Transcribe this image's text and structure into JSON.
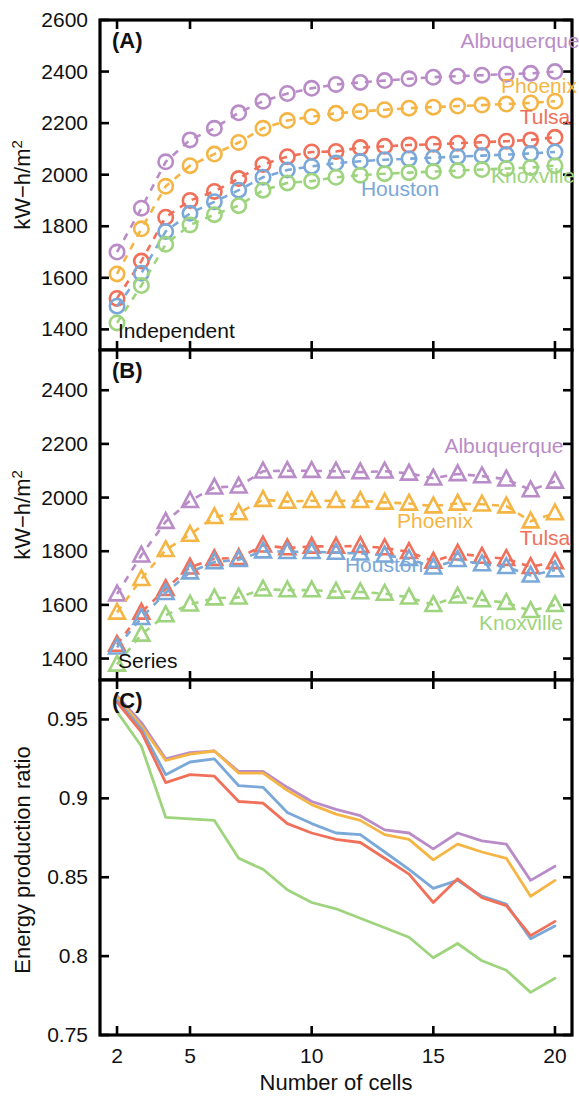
{
  "figure": {
    "xlabel": "Number of cells",
    "ylabel_ab": "kW−h/m",
    "ylabel_ab_sup": "2",
    "ylabel_c": "Energy production ratio",
    "panelA_tag": "(A)",
    "panelB_tag": "(B)",
    "panelC_tag": "(C)",
    "panelA_note": "Independent",
    "panelB_note": "Series"
  },
  "colors": {
    "albuquerque": "#b98cc8",
    "phoenix": "#f5b544",
    "tulsa": "#f0705a",
    "houston": "#7aa8d8",
    "knoxville": "#9ed47e",
    "axis": "#000000"
  },
  "labels_A": [
    {
      "name": "Albuquerque",
      "x": 520,
      "y": 48,
      "anchor": "middle",
      "color": "#b98cc8"
    },
    {
      "name": "Phoenix",
      "x": 539,
      "y": 93,
      "anchor": "middle",
      "color": "#f5b544"
    },
    {
      "name": "Tulsa",
      "x": 545,
      "y": 124,
      "anchor": "middle",
      "color": "#f0705a"
    },
    {
      "name": "Houston",
      "x": 400,
      "y": 196,
      "anchor": "middle",
      "color": "#7aa8d8"
    },
    {
      "name": "Knoxville",
      "x": 533,
      "y": 183,
      "anchor": "middle",
      "color": "#9ed47e"
    }
  ],
  "labels_B": [
    {
      "name": "Albuquerque",
      "x": 504,
      "y": 453,
      "anchor": "middle",
      "color": "#b98cc8"
    },
    {
      "name": "Phoenix",
      "x": 435,
      "y": 528,
      "anchor": "middle",
      "color": "#f5b544"
    },
    {
      "name": "Tulsa",
      "x": 545,
      "y": 545,
      "anchor": "middle",
      "color": "#f0705a"
    },
    {
      "name": "Houston",
      "x": 384,
      "y": 572,
      "anchor": "middle",
      "color": "#7aa8d8"
    },
    {
      "name": "Knoxville",
      "x": 521,
      "y": 630,
      "anchor": "middle",
      "color": "#9ed47e"
    }
  ],
  "chart_data": [
    {
      "type": "line",
      "panel": "A",
      "title": "(A) Independent",
      "xlabel": "Number of cells",
      "ylabel": "kW−h/m2",
      "xlim": [
        1.3,
        20.7
      ],
      "ylim": [
        1320,
        2600
      ],
      "xticks": [
        2,
        5,
        10,
        15,
        20
      ],
      "yticks": [
        1400,
        1600,
        1800,
        2000,
        2200,
        2400,
        2600
      ],
      "grid": false,
      "marker": "circle",
      "linestyle": "dashed",
      "legend_position": "inline-annotations",
      "x": [
        2,
        3,
        4,
        5,
        6,
        7,
        8,
        9,
        10,
        11,
        12,
        13,
        14,
        15,
        16,
        17,
        18,
        19,
        20
      ],
      "series": [
        {
          "name": "Albuquerque",
          "color": "#b98cc8",
          "values": [
            1700,
            1870,
            2050,
            2135,
            2180,
            2240,
            2285,
            2315,
            2335,
            2350,
            2358,
            2365,
            2372,
            2378,
            2382,
            2386,
            2390,
            2393,
            2400
          ]
        },
        {
          "name": "Phoenix",
          "color": "#f5b544",
          "values": [
            1615,
            1790,
            1955,
            2035,
            2080,
            2125,
            2180,
            2210,
            2225,
            2238,
            2245,
            2252,
            2258,
            2262,
            2266,
            2270,
            2274,
            2278,
            2285
          ]
        },
        {
          "name": "Tulsa",
          "color": "#f0705a",
          "values": [
            1520,
            1665,
            1835,
            1900,
            1935,
            1985,
            2040,
            2070,
            2088,
            2090,
            2105,
            2110,
            2115,
            2118,
            2122,
            2126,
            2130,
            2135,
            2145
          ]
        },
        {
          "name": "Houston",
          "color": "#7aa8d8",
          "values": [
            1490,
            1618,
            1780,
            1850,
            1895,
            1940,
            1990,
            2018,
            2032,
            2045,
            2052,
            2058,
            2062,
            2066,
            2070,
            2074,
            2078,
            2082,
            2088
          ]
        },
        {
          "name": "Knoxville",
          "color": "#9ed47e",
          "values": [
            1425,
            1570,
            1730,
            1805,
            1845,
            1880,
            1940,
            1968,
            1975,
            1990,
            1998,
            2004,
            2008,
            2012,
            2016,
            2020,
            2024,
            2028,
            2035
          ]
        }
      ]
    },
    {
      "type": "line",
      "panel": "B",
      "title": "(B) Series",
      "xlabel": "Number of cells",
      "ylabel": "kW−h/m2",
      "xlim": [
        1.3,
        20.7
      ],
      "ylim": [
        1320,
        2550
      ],
      "xticks": [
        2,
        5,
        10,
        15,
        20
      ],
      "yticks": [
        1400,
        1600,
        1800,
        2000,
        2200,
        2400
      ],
      "grid": false,
      "marker": "triangle",
      "linestyle": "dashed",
      "legend_position": "inline-annotations",
      "x": [
        2,
        3,
        4,
        5,
        6,
        7,
        8,
        9,
        10,
        11,
        12,
        13,
        14,
        15,
        16,
        17,
        18,
        19,
        20
      ],
      "series": [
        {
          "name": "Albuquerque",
          "color": "#b98cc8",
          "values": [
            1640,
            1785,
            1910,
            1988,
            2038,
            2042,
            2098,
            2100,
            2100,
            2098,
            2095,
            2098,
            2090,
            2072,
            2088,
            2080,
            2068,
            2028,
            2060
          ]
        },
        {
          "name": "Phoenix",
          "color": "#f5b544",
          "values": [
            1572,
            1697,
            1805,
            1862,
            1928,
            1942,
            1992,
            1985,
            1988,
            1988,
            1988,
            1982,
            1978,
            1968,
            1978,
            1975,
            1968,
            1912,
            1942
          ]
        },
        {
          "name": "Tulsa",
          "color": "#f0705a",
          "values": [
            1452,
            1572,
            1660,
            1740,
            1772,
            1775,
            1822,
            1812,
            1818,
            1818,
            1820,
            1812,
            1798,
            1762,
            1792,
            1780,
            1772,
            1742,
            1760
          ]
        },
        {
          "name": "Houston",
          "color": "#7aa8d8",
          "values": [
            1442,
            1552,
            1645,
            1722,
            1760,
            1768,
            1800,
            1798,
            1798,
            1795,
            1792,
            1785,
            1772,
            1740,
            1768,
            1752,
            1742,
            1710,
            1730
          ]
        },
        {
          "name": "Knoxville",
          "color": "#9ed47e",
          "values": [
            1378,
            1490,
            1562,
            1602,
            1625,
            1628,
            1658,
            1655,
            1655,
            1650,
            1648,
            1642,
            1628,
            1600,
            1632,
            1618,
            1608,
            1578,
            1600
          ]
        }
      ]
    },
    {
      "type": "line",
      "panel": "C",
      "title": "(C)",
      "xlabel": "Number of cells",
      "ylabel": "Energy production ratio",
      "xlim": [
        1.3,
        20.7
      ],
      "ylim": [
        0.75,
        0.975
      ],
      "xticks": [
        2,
        5,
        10,
        15,
        20
      ],
      "yticks": [
        0.75,
        0.8,
        0.85,
        0.9,
        0.95
      ],
      "grid": false,
      "marker": "none",
      "linestyle": "solid",
      "legend_position": "none",
      "x": [
        2,
        3,
        4,
        5,
        6,
        7,
        8,
        9,
        10,
        11,
        12,
        13,
        14,
        15,
        16,
        17,
        18,
        19,
        20
      ],
      "series": [
        {
          "name": "Albuquerque",
          "color": "#b98cc8",
          "values": [
            0.965,
            0.948,
            0.925,
            0.929,
            0.93,
            0.917,
            0.917,
            0.907,
            0.898,
            0.893,
            0.889,
            0.88,
            0.878,
            0.868,
            0.878,
            0.873,
            0.871,
            0.848,
            0.857
          ]
        },
        {
          "name": "Phoenix",
          "color": "#f5b544",
          "values": [
            0.964,
            0.946,
            0.924,
            0.928,
            0.93,
            0.916,
            0.916,
            0.905,
            0.896,
            0.89,
            0.886,
            0.877,
            0.874,
            0.861,
            0.871,
            0.866,
            0.862,
            0.838,
            0.848
          ]
        },
        {
          "name": "Houston",
          "color": "#7aa8d8",
          "values": [
            0.962,
            0.944,
            0.915,
            0.923,
            0.925,
            0.908,
            0.907,
            0.891,
            0.884,
            0.878,
            0.877,
            0.866,
            0.855,
            0.843,
            0.848,
            0.838,
            0.833,
            0.811,
            0.819
          ]
        },
        {
          "name": "Tulsa",
          "color": "#f0705a",
          "values": [
            0.961,
            0.942,
            0.91,
            0.915,
            0.914,
            0.898,
            0.897,
            0.884,
            0.878,
            0.874,
            0.872,
            0.862,
            0.852,
            0.834,
            0.849,
            0.837,
            0.832,
            0.813,
            0.822
          ]
        },
        {
          "name": "Knoxville",
          "color": "#9ed47e",
          "values": [
            0.955,
            0.933,
            0.888,
            0.887,
            0.886,
            0.862,
            0.855,
            0.842,
            0.834,
            0.83,
            0.824,
            0.818,
            0.812,
            0.799,
            0.808,
            0.797,
            0.791,
            0.777,
            0.786
          ]
        }
      ]
    }
  ]
}
